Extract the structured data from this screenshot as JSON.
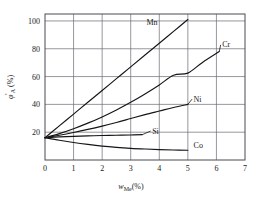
{
  "chart_data": {
    "type": "line",
    "title": "",
    "subtitle": "",
    "xlabel": "w",
    "xlabel_sub": "Me",
    "xlabel_unit": "(%)",
    "ylabel": "φ",
    "ylabel_sub": "A",
    "ylabel_prime": "'",
    "ylabel_unit": "(%)",
    "xlim": [
      0,
      7
    ],
    "ylim": [
      0,
      105
    ],
    "grid": true,
    "legend_position": "inline-end-labels",
    "xticks": [
      "0",
      "1",
      "2",
      "3",
      "4",
      "5",
      "6",
      "7"
    ],
    "xtick_values": [
      0,
      1,
      2,
      3,
      4,
      5,
      6,
      7
    ],
    "yticks": [
      "20",
      "40",
      "60",
      "80",
      "100"
    ],
    "ytick_values": [
      20,
      40,
      60,
      80,
      100
    ],
    "common_origin": {
      "x": 0,
      "y": 16
    },
    "series": [
      {
        "name": "Mn",
        "label": "Mn",
        "label_x": 3.55,
        "label_y": 97,
        "leader": false,
        "points": [
          {
            "x": 0.0,
            "y": 16.0
          },
          {
            "x": 0.5,
            "y": 24.5
          },
          {
            "x": 1.0,
            "y": 33.0
          },
          {
            "x": 1.5,
            "y": 41.5
          },
          {
            "x": 2.0,
            "y": 50.0
          },
          {
            "x": 2.5,
            "y": 58.5
          },
          {
            "x": 3.0,
            "y": 67.0
          },
          {
            "x": 3.5,
            "y": 75.5
          },
          {
            "x": 4.0,
            "y": 84.0
          },
          {
            "x": 4.5,
            "y": 92.5
          },
          {
            "x": 5.0,
            "y": 101.0
          }
        ]
      },
      {
        "name": "Cr",
        "label": "Cr",
        "label_x": 6.2,
        "label_y": 81,
        "leader": true,
        "leader_from_x": 6.1,
        "leader_from_y": 78,
        "points": [
          {
            "x": 0.0,
            "y": 16.0
          },
          {
            "x": 0.5,
            "y": 19.0
          },
          {
            "x": 1.0,
            "y": 22.5
          },
          {
            "x": 1.5,
            "y": 26.5
          },
          {
            "x": 2.0,
            "y": 31.0
          },
          {
            "x": 2.5,
            "y": 36.0
          },
          {
            "x": 3.0,
            "y": 41.5
          },
          {
            "x": 3.5,
            "y": 47.5
          },
          {
            "x": 4.0,
            "y": 54.0
          },
          {
            "x": 4.5,
            "y": 61.0
          },
          {
            "x": 5.0,
            "y": 62.5
          },
          {
            "x": 5.5,
            "y": 70.0
          },
          {
            "x": 6.1,
            "y": 78.0
          }
        ]
      },
      {
        "name": "Ni",
        "label": "Ni",
        "label_x": 5.2,
        "label_y": 42,
        "leader": true,
        "leader_from_x": 5.0,
        "leader_from_y": 40,
        "points": [
          {
            "x": 0.0,
            "y": 16.0
          },
          {
            "x": 0.5,
            "y": 17.8
          },
          {
            "x": 1.0,
            "y": 19.8
          },
          {
            "x": 1.5,
            "y": 22.0
          },
          {
            "x": 2.0,
            "y": 24.4
          },
          {
            "x": 2.5,
            "y": 27.0
          },
          {
            "x": 3.0,
            "y": 29.8
          },
          {
            "x": 3.5,
            "y": 32.6
          },
          {
            "x": 4.0,
            "y": 35.2
          },
          {
            "x": 4.5,
            "y": 37.8
          },
          {
            "x": 5.0,
            "y": 40.0
          }
        ]
      },
      {
        "name": "Si",
        "label": "Si",
        "label_x": 3.75,
        "label_y": 19,
        "leader": true,
        "leader_from_x": 3.4,
        "leader_from_y": 18.2,
        "points": [
          {
            "x": 0.0,
            "y": 16.0
          },
          {
            "x": 0.5,
            "y": 16.6
          },
          {
            "x": 1.0,
            "y": 17.0
          },
          {
            "x": 1.5,
            "y": 17.3
          },
          {
            "x": 2.0,
            "y": 17.6
          },
          {
            "x": 2.5,
            "y": 17.8
          },
          {
            "x": 3.0,
            "y": 18.0
          },
          {
            "x": 3.4,
            "y": 18.2
          }
        ]
      },
      {
        "name": "Co",
        "label": "Co",
        "label_x": 5.2,
        "label_y": 8.5,
        "leader": false,
        "points": [
          {
            "x": 0.0,
            "y": 16.0
          },
          {
            "x": 0.5,
            "y": 14.2
          },
          {
            "x": 1.0,
            "y": 12.6
          },
          {
            "x": 1.5,
            "y": 11.2
          },
          {
            "x": 2.0,
            "y": 10.0
          },
          {
            "x": 2.5,
            "y": 9.1
          },
          {
            "x": 3.0,
            "y": 8.4
          },
          {
            "x": 3.5,
            "y": 7.9
          },
          {
            "x": 4.0,
            "y": 7.5
          },
          {
            "x": 4.5,
            "y": 7.2
          },
          {
            "x": 5.0,
            "y": 7.0
          }
        ]
      }
    ],
    "colors": {
      "curve": "#151515",
      "frame": "#4a4a52",
      "grid": "#6a6a72",
      "background": "#ffffff",
      "text": "#1a1a1a"
    }
  }
}
